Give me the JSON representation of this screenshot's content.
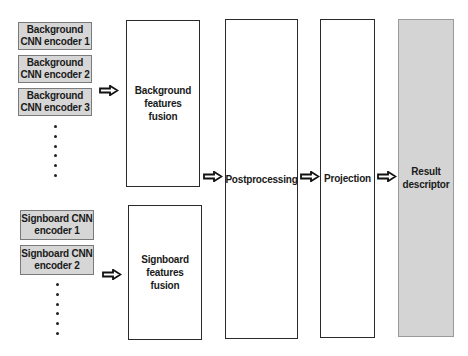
{
  "diagram": {
    "background_encoders": [
      {
        "label": "Background CNN encoder 1"
      },
      {
        "label": "Background CNN encoder 2"
      },
      {
        "label": "Background CNN encoder 3"
      }
    ],
    "signboard_encoders": [
      {
        "label": "Signboard CNN encoder 1"
      },
      {
        "label": "Signboard CNN encoder 2"
      }
    ],
    "ellipsis": "⋮",
    "background_fusion": {
      "label": "Background features fusion"
    },
    "signboard_fusion": {
      "label": "Signboard features fusion"
    },
    "postprocessing": {
      "label": "Postprocessing"
    },
    "projection": {
      "label": "Projection"
    },
    "result": {
      "label": "Result descriptor"
    },
    "colors": {
      "encoder_fill": "#d6d6d6",
      "encoder_border": "#7a7a7a",
      "stage_border": "#2a2a2a",
      "result_fill": "#d4d4d4",
      "result_border": "#9a9a9a"
    }
  }
}
